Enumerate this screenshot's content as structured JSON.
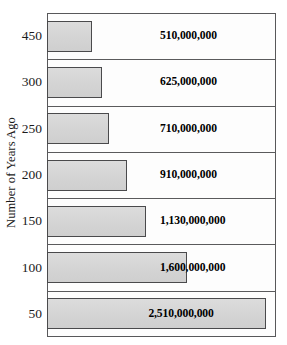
{
  "chart_data": {
    "type": "bar",
    "orientation": "horizontal",
    "title": "",
    "xlabel": "",
    "ylabel": "Number of Years Ago",
    "categories": [
      "450",
      "300",
      "250",
      "200",
      "150",
      "100",
      "50"
    ],
    "values": [
      510000000,
      625000000,
      710000000,
      910000000,
      1130000000,
      1600000000,
      2510000000
    ],
    "value_labels": [
      "510,000,000",
      "625,000,000",
      "710,000,000",
      "910,000,000",
      "1,130,000,000",
      "1,600,000,000",
      "2,510,000,000"
    ],
    "xlim": [
      0,
      2620000000
    ],
    "grid": false,
    "legend": false,
    "bar_fill_color": "#d7d7d7",
    "bar_border_color": "#4a4a4c",
    "frame_color": "#58585a",
    "background_color": "#ffffff",
    "text_color": "#1b1b1b",
    "bars": [
      {
        "category": "450",
        "value": 510000000,
        "label": "510,000,000",
        "label_inside": false
      },
      {
        "category": "300",
        "value": 625000000,
        "label": "625,000,000",
        "label_inside": false
      },
      {
        "category": "250",
        "value": 710000000,
        "label": "710,000,000",
        "label_inside": false
      },
      {
        "category": "200",
        "value": 910000000,
        "label": "910,000,000",
        "label_inside": false
      },
      {
        "category": "150",
        "value": 1130000000,
        "label": "1,130,000,000",
        "label_inside": false
      },
      {
        "category": "100",
        "value": 1600000000,
        "label": "1,600,000,000",
        "label_inside": false
      },
      {
        "category": "50",
        "value": 2510000000,
        "label": "2,510,000,000",
        "label_inside": true
      }
    ]
  }
}
